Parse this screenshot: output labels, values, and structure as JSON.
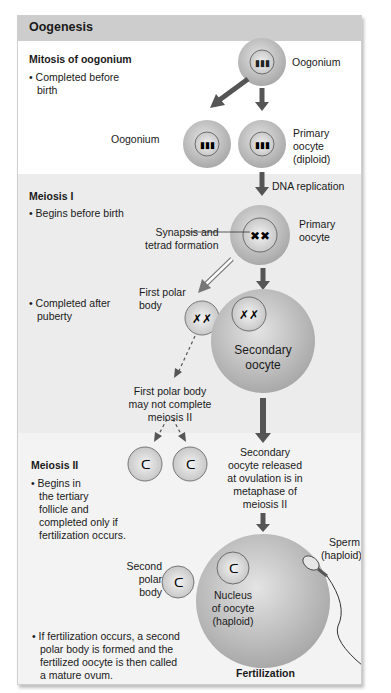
{
  "title": "Oogenesis",
  "sections": {
    "mitosis": {
      "heading": "Mitosis of oogonium",
      "bullet": "• Completed before",
      "bullet_2": "birth"
    },
    "meiosis1": {
      "heading": "Meiosis I",
      "bullet_1": "• Begins before birth",
      "bullet_2a": "• Completed after",
      "bullet_2b": "puberty"
    },
    "meiosis2": {
      "heading": "Meiosis II",
      "bullet_lines": [
        "• Begins in",
        "the tertiary",
        "follicle and",
        "completed only if",
        "fertilization occurs."
      ],
      "final_lines": [
        "• If fertilization occurs, a second",
        "polar body is formed and the",
        "fertilized oocyte is then called",
        "a mature ovum."
      ]
    }
  },
  "labels": {
    "oogonium_top": "Oogonium",
    "oogonium_left": "Oogonium",
    "primary_oocyte_diploid": [
      "Primary",
      "oocyte",
      "(diploid)"
    ],
    "dna_replication": "DNA replication",
    "primary_oocyte": [
      "Primary",
      "oocyte"
    ],
    "synapsis": [
      "Synapsis and",
      "tetrad formation"
    ],
    "first_polar_body": [
      "First polar",
      "body"
    ],
    "secondary_oocyte": [
      "Secondary",
      "oocyte"
    ],
    "first_polar_note": [
      "First polar body",
      "may not complete",
      "meiosis II"
    ],
    "secondary_released": [
      "Secondary",
      "oocyte released",
      "at ovulation is in",
      "metaphase of",
      "meiosis II"
    ],
    "second_polar_body": [
      "Second",
      "polar",
      "body"
    ],
    "sperm": [
      "Sperm",
      "(haploid)"
    ],
    "nucleus": [
      "Nucleus",
      "of oocyte",
      "(haploid)"
    ],
    "fertilization": "Fertilization"
  },
  "colors": {
    "header": "#cdcdcd",
    "band": "#ececec",
    "cell": "#b8b8b8",
    "arrow": "#555555"
  }
}
